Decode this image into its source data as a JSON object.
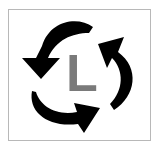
{
  "logo": {
    "letter": "L",
    "letter_color": "#7a7a7a",
    "arrow_color": "#000000",
    "frame_color": "#b8b8b8",
    "icons": [
      "cycle-arrow-top-left-icon",
      "cycle-arrow-right-icon",
      "cycle-arrow-bottom-icon"
    ]
  }
}
